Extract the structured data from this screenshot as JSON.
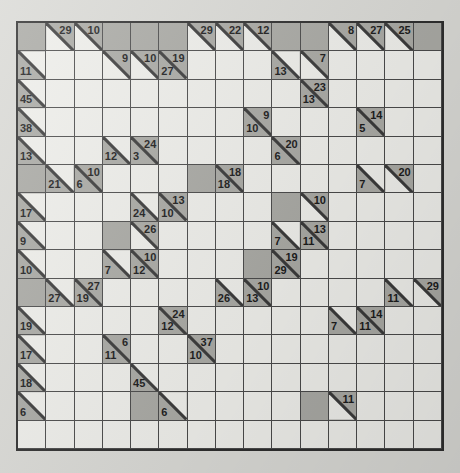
{
  "puzzle": {
    "type": "kakuro",
    "rows": 15,
    "cols": 15,
    "colors": {
      "page_background": "#d9d9d5",
      "open_cell": "#eeeeea",
      "block_cell": "#a9a9a4",
      "grid_line": "#4a4a4a",
      "border": "#2e2e2e",
      "clue_text": "#1c1c1c"
    },
    "legend": {
      "down_label": "down-clue",
      "across_label": "across-clue"
    },
    "cells": [
      [
        {
          "t": "block"
        },
        {
          "t": "clue",
          "down": "29"
        },
        {
          "t": "clue",
          "down": "10"
        },
        {
          "t": "block"
        },
        {
          "t": "block"
        },
        {
          "t": "block"
        },
        {
          "t": "clue",
          "down": "29"
        },
        {
          "t": "clue",
          "down": "22"
        },
        {
          "t": "clue",
          "down": "12"
        },
        {
          "t": "block"
        },
        {
          "t": "block"
        },
        {
          "t": "clue",
          "down": "8"
        },
        {
          "t": "clue",
          "down": "27"
        },
        {
          "t": "clue",
          "down": "25"
        },
        {
          "t": "block"
        }
      ],
      [
        {
          "t": "clue",
          "across": "11"
        },
        {
          "t": "open"
        },
        {
          "t": "open"
        },
        {
          "t": "clue",
          "down": "9"
        },
        {
          "t": "clue",
          "down": "10"
        },
        {
          "t": "clue",
          "down": "19",
          "across": "27"
        },
        {
          "t": "open"
        },
        {
          "t": "open"
        },
        {
          "t": "open"
        },
        {
          "t": "clue",
          "across": "13"
        },
        {
          "t": "clue",
          "down": "7"
        },
        {
          "t": "open"
        },
        {
          "t": "open"
        },
        {
          "t": "open"
        },
        {
          "t": "open"
        }
      ],
      [
        {
          "t": "clue",
          "across": "45"
        },
        {
          "t": "open"
        },
        {
          "t": "open"
        },
        {
          "t": "open"
        },
        {
          "t": "open"
        },
        {
          "t": "open"
        },
        {
          "t": "open"
        },
        {
          "t": "open"
        },
        {
          "t": "open"
        },
        {
          "t": "open"
        },
        {
          "t": "clue",
          "down": "23",
          "across": "13"
        },
        {
          "t": "open"
        },
        {
          "t": "open"
        },
        {
          "t": "open"
        },
        {
          "t": "open"
        }
      ],
      [
        {
          "t": "clue",
          "across": "38"
        },
        {
          "t": "open"
        },
        {
          "t": "open"
        },
        {
          "t": "open"
        },
        {
          "t": "open"
        },
        {
          "t": "open"
        },
        {
          "t": "open"
        },
        {
          "t": "open"
        },
        {
          "t": "clue",
          "down": "9",
          "across": "10"
        },
        {
          "t": "open"
        },
        {
          "t": "open"
        },
        {
          "t": "open"
        },
        {
          "t": "clue",
          "down": "14",
          "across": "5"
        },
        {
          "t": "open"
        },
        {
          "t": "open"
        }
      ],
      [
        {
          "t": "clue",
          "across": "13"
        },
        {
          "t": "open"
        },
        {
          "t": "open"
        },
        {
          "t": "clue",
          "across": "12"
        },
        {
          "t": "clue",
          "down": "24",
          "across": "3"
        },
        {
          "t": "open"
        },
        {
          "t": "open"
        },
        {
          "t": "open"
        },
        {
          "t": "open"
        },
        {
          "t": "clue",
          "down": "20",
          "across": "6"
        },
        {
          "t": "open"
        },
        {
          "t": "open"
        },
        {
          "t": "open"
        },
        {
          "t": "open"
        },
        {
          "t": "open"
        }
      ],
      [
        {
          "t": "block"
        },
        {
          "t": "clue",
          "across": "21"
        },
        {
          "t": "clue",
          "down": "10",
          "across": "6"
        },
        {
          "t": "open"
        },
        {
          "t": "open"
        },
        {
          "t": "open"
        },
        {
          "t": "block"
        },
        {
          "t": "clue",
          "down": "18",
          "across": "18"
        },
        {
          "t": "open"
        },
        {
          "t": "open"
        },
        {
          "t": "open"
        },
        {
          "t": "open"
        },
        {
          "t": "clue",
          "across": "7"
        },
        {
          "t": "clue",
          "down": "20"
        },
        {
          "t": "open"
        }
      ],
      [
        {
          "t": "clue",
          "across": "17"
        },
        {
          "t": "open"
        },
        {
          "t": "open"
        },
        {
          "t": "open"
        },
        {
          "t": "clue",
          "across": "24"
        },
        {
          "t": "clue",
          "down": "13",
          "across": "10"
        },
        {
          "t": "open"
        },
        {
          "t": "open"
        },
        {
          "t": "open"
        },
        {
          "t": "block"
        },
        {
          "t": "clue",
          "down": "10"
        },
        {
          "t": "open"
        },
        {
          "t": "open"
        },
        {
          "t": "open"
        },
        {
          "t": "open"
        }
      ],
      [
        {
          "t": "clue",
          "across": "9"
        },
        {
          "t": "open"
        },
        {
          "t": "open"
        },
        {
          "t": "block"
        },
        {
          "t": "clue",
          "down": "26"
        },
        {
          "t": "open"
        },
        {
          "t": "open"
        },
        {
          "t": "open"
        },
        {
          "t": "open"
        },
        {
          "t": "clue",
          "across": "7"
        },
        {
          "t": "clue",
          "down": "13",
          "across": "11"
        },
        {
          "t": "open"
        },
        {
          "t": "open"
        },
        {
          "t": "open"
        },
        {
          "t": "open"
        }
      ],
      [
        {
          "t": "clue",
          "across": "10"
        },
        {
          "t": "open"
        },
        {
          "t": "open"
        },
        {
          "t": "clue",
          "across": "7"
        },
        {
          "t": "clue",
          "down": "10",
          "across": "12"
        },
        {
          "t": "open"
        },
        {
          "t": "open"
        },
        {
          "t": "open"
        },
        {
          "t": "block"
        },
        {
          "t": "clue",
          "down": "19",
          "across": "29"
        },
        {
          "t": "open"
        },
        {
          "t": "open"
        },
        {
          "t": "open"
        },
        {
          "t": "open"
        },
        {
          "t": "open"
        }
      ],
      [
        {
          "t": "block"
        },
        {
          "t": "clue",
          "across": "27"
        },
        {
          "t": "clue",
          "down": "27",
          "across": "19"
        },
        {
          "t": "open"
        },
        {
          "t": "open"
        },
        {
          "t": "open"
        },
        {
          "t": "open"
        },
        {
          "t": "clue",
          "across": "26"
        },
        {
          "t": "clue",
          "down": "10",
          "across": "13"
        },
        {
          "t": "open"
        },
        {
          "t": "open"
        },
        {
          "t": "open"
        },
        {
          "t": "open"
        },
        {
          "t": "clue",
          "across": "11"
        },
        {
          "t": "clue",
          "down": "29"
        }
      ],
      [
        {
          "t": "clue",
          "across": "19"
        },
        {
          "t": "open"
        },
        {
          "t": "open"
        },
        {
          "t": "open"
        },
        {
          "t": "open"
        },
        {
          "t": "clue",
          "down": "24",
          "across": "12"
        },
        {
          "t": "open"
        },
        {
          "t": "open"
        },
        {
          "t": "open"
        },
        {
          "t": "open"
        },
        {
          "t": "open"
        },
        {
          "t": "clue",
          "across": "7"
        },
        {
          "t": "clue",
          "down": "14",
          "across": "11"
        },
        {
          "t": "open"
        },
        {
          "t": "open"
        }
      ],
      [
        {
          "t": "clue",
          "across": "17"
        },
        {
          "t": "open"
        },
        {
          "t": "open"
        },
        {
          "t": "clue",
          "down": "6",
          "across": "11"
        },
        {
          "t": "open"
        },
        {
          "t": "open"
        },
        {
          "t": "clue",
          "down": "37",
          "across": "10"
        },
        {
          "t": "open"
        },
        {
          "t": "open"
        },
        {
          "t": "open"
        },
        {
          "t": "open"
        },
        {
          "t": "open"
        },
        {
          "t": "open"
        },
        {
          "t": "open"
        },
        {
          "t": "open"
        }
      ],
      [
        {
          "t": "clue",
          "across": "18"
        },
        {
          "t": "open"
        },
        {
          "t": "open"
        },
        {
          "t": "open"
        },
        {
          "t": "clue",
          "across": "45"
        },
        {
          "t": "open"
        },
        {
          "t": "open"
        },
        {
          "t": "open"
        },
        {
          "t": "open"
        },
        {
          "t": "open"
        },
        {
          "t": "open"
        },
        {
          "t": "open"
        },
        {
          "t": "open"
        },
        {
          "t": "open"
        },
        {
          "t": "open"
        }
      ],
      [
        {
          "t": "clue",
          "across": "6"
        },
        {
          "t": "open"
        },
        {
          "t": "open"
        },
        {
          "t": "open"
        },
        {
          "t": "block"
        },
        {
          "t": "clue",
          "across": "6"
        },
        {
          "t": "open"
        },
        {
          "t": "open"
        },
        {
          "t": "open"
        },
        {
          "t": "open"
        },
        {
          "t": "block"
        },
        {
          "t": "clue",
          "down": "11"
        },
        {
          "t": "open"
        },
        {
          "t": "open"
        },
        {
          "t": "open"
        }
      ],
      [
        {
          "t": "open"
        },
        {
          "t": "open"
        },
        {
          "t": "open"
        },
        {
          "t": "open"
        },
        {
          "t": "open"
        },
        {
          "t": "open"
        },
        {
          "t": "open"
        },
        {
          "t": "open"
        },
        {
          "t": "open"
        },
        {
          "t": "open"
        },
        {
          "t": "open"
        },
        {
          "t": "open"
        },
        {
          "t": "open"
        },
        {
          "t": "open"
        },
        {
          "t": "open"
        }
      ]
    ]
  }
}
